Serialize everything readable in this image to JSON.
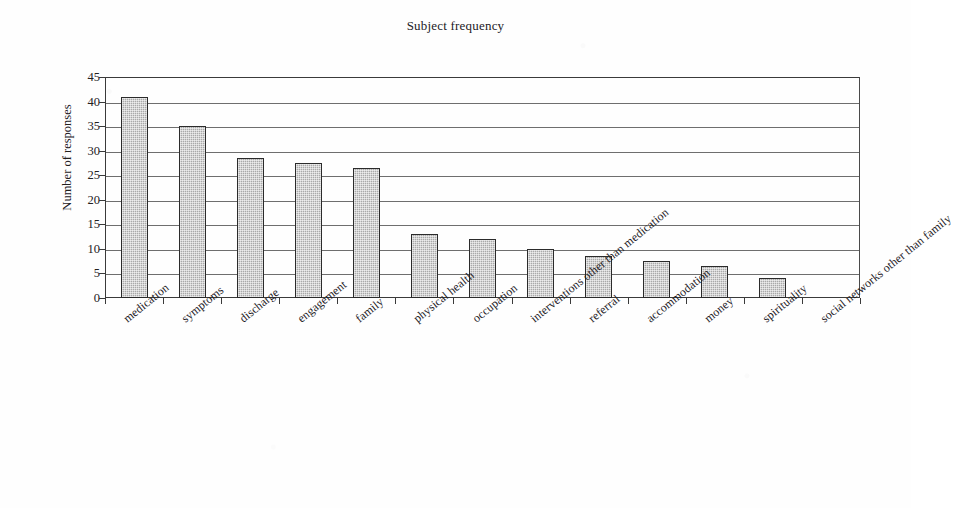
{
  "chart_data": {
    "type": "bar",
    "title": "Subject frequency",
    "xlabel": "",
    "ylabel": "Number of responses",
    "ylim": [
      0,
      45
    ],
    "ytick_step": 5,
    "yticks": [
      0,
      5,
      10,
      15,
      20,
      25,
      30,
      35,
      40,
      45
    ],
    "grid": "horizontal",
    "legend": "none",
    "categories": [
      "medication",
      "symptoms",
      "discharge",
      "engagement",
      "family",
      "physical health",
      "occupation",
      "interventions other than medication",
      "referral",
      "accommodation",
      "money",
      "spirituality",
      "social networks other than family"
    ],
    "values": [
      41,
      35,
      28.5,
      27.5,
      26.5,
      13,
      12,
      10,
      8.5,
      7.5,
      6.5,
      4,
      0
    ],
    "bar_fill_color": "#a9a9a9",
    "bar_border_color": "#2b2b2b",
    "axis_color": "#3a3a3a",
    "gridline_color": "#6e6e6e",
    "background_color": "#fefefe"
  }
}
